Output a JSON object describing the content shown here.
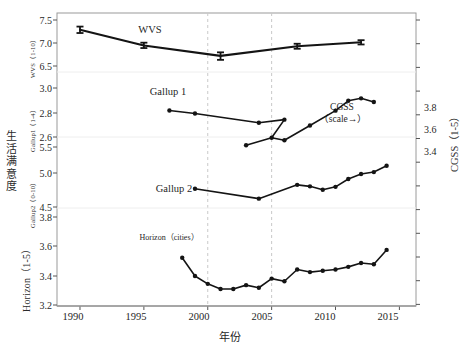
{
  "chart_data": {
    "type": "line",
    "title": "",
    "xlabel": "年份",
    "ylabel": "生活满意度",
    "xlim": [
      1988.2,
      2016.3
    ],
    "xticks": [
      1990,
      1995,
      2000,
      2005,
      2010,
      2015
    ],
    "grid": "dashed vertical gridlines at 2000 and 2005; faint horizontal panel separators",
    "legend_position": "inline annotations next to each series",
    "panels": [
      {
        "name": "WVS",
        "axis_caption": "WVS（1-10）",
        "scale_label": "1-10",
        "yticks": [
          6.5,
          7.0,
          7.5
        ],
        "ylim": [
          6.25,
          7.62
        ]
      },
      {
        "name": "Gallup1",
        "axis_caption": "Gallup1（1-4）",
        "scale_label": "1-4",
        "yticks": [
          2.6,
          2.8,
          3.0
        ],
        "ylim": [
          2.55,
          3.06
        ]
      },
      {
        "name": "Gallup2",
        "axis_caption": "Gallup2（0-10）",
        "scale_label": "0-10",
        "yticks": [
          4.5,
          5.0,
          5.5
        ],
        "ylim": [
          4.36,
          5.62
        ]
      },
      {
        "name": "Horizon",
        "axis_caption": "Horizon（1-5）",
        "scale_label": "1-5",
        "yticks": [
          3.2,
          3.4,
          3.6,
          3.8
        ],
        "ylim": [
          3.17,
          3.86
        ]
      },
      {
        "name": "CGSS",
        "axis_caption": "CGSS（1-5）",
        "scale_label": "1-5",
        "side": "right",
        "yticks": [
          3.4,
          3.6,
          3.8
        ],
        "ylim": [
          3.32,
          3.88
        ]
      }
    ],
    "series": [
      {
        "name": "WVS",
        "label": "WVS",
        "axis": "WVS (1-10)",
        "marker": "errorbar",
        "x": [
          1990,
          1995,
          2001,
          2007,
          2012
        ],
        "values": [
          7.29,
          6.85,
          6.56,
          6.83,
          6.94
        ],
        "err_low": [
          7.2,
          6.78,
          6.45,
          6.76,
          6.88
        ],
        "err_high": [
          7.38,
          6.93,
          6.66,
          6.9,
          7.0
        ]
      },
      {
        "name": "Gallup 1",
        "label": "Gallup 1",
        "axis": "Gallup1 (1-4)",
        "marker": "dot",
        "x": [
          1997,
          1999,
          2004,
          2006
        ],
        "values": [
          2.82,
          2.79,
          2.7,
          2.73
        ]
      },
      {
        "name": "CGSS",
        "label": "CGSS",
        "sublabel": "（scale→）",
        "axis": "CGSS (1-5) right",
        "marker": "dot",
        "x": [
          2003,
          2005,
          2006,
          2008,
          2010,
          2011,
          2012,
          2013
        ],
        "values": [
          3.42,
          3.48,
          3.46,
          3.58,
          3.7,
          3.78,
          3.8,
          3.77
        ]
      },
      {
        "name": "Gallup 2",
        "label": "Gallup 2",
        "axis": "Gallup2 (0-10)",
        "marker": "dot",
        "x": [
          1999,
          2004,
          2007,
          2008,
          2009,
          2010,
          2011,
          2012,
          2013
        ],
        "values": [
          4.75,
          4.55,
          4.83,
          4.8,
          4.73,
          4.79,
          4.95,
          5.05,
          5.09
        ],
        "values_tail": [
          5.22
        ]
      },
      {
        "name": "Horizon (cities)",
        "label": "Horizon（cities）",
        "axis": "Horizon (1-5)",
        "marker": "dot",
        "x": [
          1998,
          1999,
          2000,
          2001,
          2002,
          2003,
          2004,
          2005,
          2006,
          2007,
          2008,
          2009,
          2010,
          2011,
          2012,
          2013,
          2014
        ],
        "values": [
          3.54,
          3.4,
          3.34,
          3.3,
          3.3,
          3.33,
          3.31,
          3.38,
          3.36,
          3.45,
          3.43,
          3.44,
          3.45,
          3.47,
          3.5,
          3.49,
          3.6
        ]
      }
    ],
    "gridlines_x": [
      2000,
      2005
    ]
  },
  "axes": {
    "left_title": "生活满意度",
    "left_title_chars": [
      "生",
      "活",
      "满",
      "意",
      "度"
    ],
    "right_title": "CGSS（1-5）",
    "x_title": "年份",
    "captions": {
      "wvs": "WVS（1-10）",
      "gallup1": "Gallup1（1-4）",
      "gallup2": "Gallup2（0-10）",
      "horizon": "Horizon（1-5）"
    },
    "left_ticks": [
      "7.5",
      "7.0",
      "6.5",
      "3.0",
      "2.8",
      "2.6",
      "5.5",
      "5.0",
      "4.5",
      "3.8",
      "3.6",
      "3.4",
      "3.2"
    ],
    "right_ticks": [
      "3.8",
      "3.6",
      "3.4"
    ],
    "x_ticks": [
      "1990",
      "1995",
      "2000",
      "2005",
      "2010",
      "2015"
    ]
  },
  "annotations": {
    "wvs": "WVS",
    "gallup1": "Gallup 1",
    "gallup2": "Gallup 2",
    "cgss_line1": "CGSS",
    "cgss_line2": "（scale→）",
    "horizon": "Horizon（cities）"
  }
}
